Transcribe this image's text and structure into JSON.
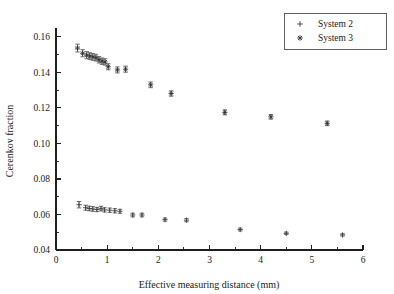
{
  "chart_data": {
    "type": "scatter",
    "title": "",
    "xlabel": "Effective measuring distance (mm)",
    "ylabel": "Cerenkov fraction",
    "xlim": [
      0,
      6
    ],
    "ylim": [
      0.04,
      0.165
    ],
    "grid": false,
    "legend_position": "top-right",
    "x_ticks": [
      0,
      1,
      2,
      3,
      4,
      5,
      6
    ],
    "x_tick_labels": [
      "0",
      "1",
      "2",
      "3",
      "4",
      "5",
      "6"
    ],
    "x_minor_ticks": [
      0.5,
      1.5,
      2.5,
      3.5,
      4.5,
      5.5
    ],
    "y_ticks": [
      0.04,
      0.06,
      0.08,
      0.1,
      0.12,
      0.14,
      0.16
    ],
    "y_tick_labels": [
      "0.04",
      "0.06",
      "0.08",
      "0.10",
      "0.12",
      "0.14",
      "0.16"
    ],
    "y_minor_ticks": [
      0.05,
      0.07,
      0.09,
      0.11,
      0.13,
      0.15
    ],
    "error_bars": true,
    "series": [
      {
        "name": "System 2",
        "marker": "plus",
        "color": "#3c3c3c",
        "points": [
          {
            "x": 0.45,
            "y": 0.0655,
            "yerr": 0.0018
          },
          {
            "x": 0.58,
            "y": 0.0638,
            "yerr": 0.0014
          },
          {
            "x": 0.65,
            "y": 0.0634,
            "yerr": 0.0013
          },
          {
            "x": 0.72,
            "y": 0.0631,
            "yerr": 0.0013
          },
          {
            "x": 0.8,
            "y": 0.0628,
            "yerr": 0.0012
          },
          {
            "x": 0.88,
            "y": 0.0633,
            "yerr": 0.0013
          },
          {
            "x": 0.95,
            "y": 0.0626,
            "yerr": 0.0012
          },
          {
            "x": 1.05,
            "y": 0.0624,
            "yerr": 0.0012
          },
          {
            "x": 1.15,
            "y": 0.0621,
            "yerr": 0.0012
          },
          {
            "x": 1.25,
            "y": 0.0618,
            "yerr": 0.0011
          },
          {
            "x": 1.5,
            "y": 0.0597,
            "yerr": 0.001
          },
          {
            "x": 1.68,
            "y": 0.0597,
            "yerr": 0.001
          },
          {
            "x": 2.13,
            "y": 0.0571,
            "yerr": 0.0009
          },
          {
            "x": 2.55,
            "y": 0.0568,
            "yerr": 0.0009
          },
          {
            "x": 3.6,
            "y": 0.0515,
            "yerr": 0.0008
          },
          {
            "x": 4.5,
            "y": 0.0494,
            "yerr": 0.0007
          },
          {
            "x": 5.6,
            "y": 0.0485,
            "yerr": 0.0007
          }
        ]
      },
      {
        "name": "System 3",
        "marker": "star",
        "color": "#2e2e2e",
        "points": [
          {
            "x": 0.42,
            "y": 0.1537,
            "yerr": 0.0022
          },
          {
            "x": 0.52,
            "y": 0.1508,
            "yerr": 0.002
          },
          {
            "x": 0.6,
            "y": 0.1497,
            "yerr": 0.002
          },
          {
            "x": 0.66,
            "y": 0.1492,
            "yerr": 0.0019
          },
          {
            "x": 0.72,
            "y": 0.1487,
            "yerr": 0.0019
          },
          {
            "x": 0.78,
            "y": 0.1483,
            "yerr": 0.0019
          },
          {
            "x": 0.84,
            "y": 0.1471,
            "yerr": 0.0018
          },
          {
            "x": 0.9,
            "y": 0.1463,
            "yerr": 0.0018
          },
          {
            "x": 0.96,
            "y": 0.1459,
            "yerr": 0.0018
          },
          {
            "x": 1.02,
            "y": 0.1432,
            "yerr": 0.0017
          },
          {
            "x": 1.2,
            "y": 0.1414,
            "yerr": 0.0017
          },
          {
            "x": 1.36,
            "y": 0.1418,
            "yerr": 0.0017
          },
          {
            "x": 1.85,
            "y": 0.133,
            "yerr": 0.0016
          },
          {
            "x": 2.25,
            "y": 0.1281,
            "yerr": 0.0015
          },
          {
            "x": 3.3,
            "y": 0.1175,
            "yerr": 0.0014
          },
          {
            "x": 4.2,
            "y": 0.115,
            "yerr": 0.0013
          },
          {
            "x": 5.3,
            "y": 0.1113,
            "yerr": 0.0013
          }
        ]
      }
    ]
  },
  "legend": {
    "entries": [
      {
        "label": "System 2",
        "marker": "plus"
      },
      {
        "label": "System 3",
        "marker": "star"
      }
    ]
  }
}
